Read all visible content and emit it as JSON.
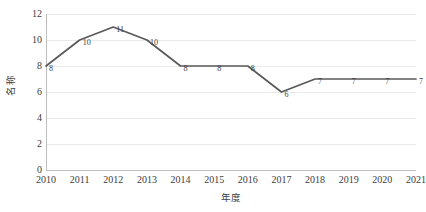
{
  "chart_data": {
    "type": "line",
    "title": "",
    "xlabel": "年度",
    "ylabel": "名称",
    "categories": [
      "2010",
      "2011",
      "2012",
      "2013",
      "2014",
      "2015",
      "2016",
      "2017",
      "2018",
      "2019",
      "2020",
      "2021"
    ],
    "values": [
      8,
      10,
      11,
      10,
      8,
      8,
      8,
      6,
      7,
      7,
      7,
      7
    ],
    "data_labels": [
      "8",
      "10",
      "11",
      "10",
      "8",
      "8",
      "8",
      "6",
      "7",
      "7",
      "7",
      "7"
    ],
    "ylim": [
      0,
      12
    ],
    "ytick_labels": [
      "0",
      "2",
      "4",
      "6",
      "8",
      "10",
      "12"
    ],
    "ytick_values": [
      0,
      2,
      4,
      6,
      8,
      10,
      12
    ],
    "grid": true,
    "legend": "none",
    "series_color": "#595959",
    "grid_color": "#e9e9e9",
    "axis_color": "#bfbfbf",
    "background_color": "#ffffff",
    "text_color": "#3d3d3d"
  }
}
